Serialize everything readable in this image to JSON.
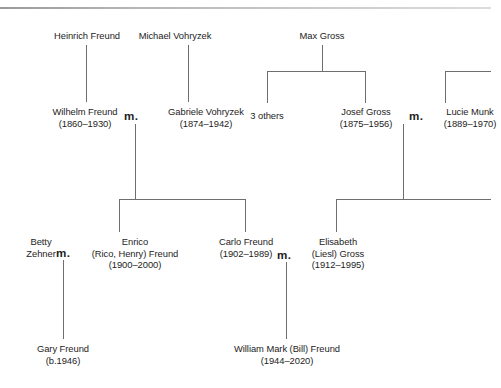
{
  "diagram": {
    "type": "family-tree",
    "title": "",
    "line_color": "#6e6e6e",
    "text_color": "#1d1d1d",
    "background": "#ffffff",
    "marriage_symbol": "m.",
    "generations": [
      {
        "row": 1,
        "people": [
          {
            "id": "heinrich-freund",
            "name": "Heinrich Freund",
            "dates": ""
          },
          {
            "id": "michael-vohryzek",
            "name": "Michael Vohryzek",
            "dates": ""
          },
          {
            "id": "max-gross",
            "name": "Max Gross",
            "dates": ""
          }
        ]
      },
      {
        "row": 2,
        "people": [
          {
            "id": "wilhelm-freund",
            "name": "Wilhelm Freund",
            "dates": "(1860–1930)"
          },
          {
            "id": "gabriele-vohryzek",
            "name": "Gabriele Vohryzek",
            "dates": "(1874–1942)"
          },
          {
            "id": "three-others",
            "name": "3 others",
            "dates": ""
          },
          {
            "id": "josef-gross",
            "name": "Josef Gross",
            "dates": "(1875–1956)"
          },
          {
            "id": "lucie-munk",
            "name": "Lucie Munk",
            "dates": "(1889–1970)"
          }
        ]
      },
      {
        "row": 3,
        "people": [
          {
            "id": "betty-zehner",
            "name": "Betty Zehner",
            "dates": ""
          },
          {
            "id": "enrico-freund",
            "name": "Enrico (Rico, Henry) Freund",
            "dates": "(1900–2000)"
          },
          {
            "id": "carlo-freund",
            "name": "Carlo Freund",
            "dates": "(1902–1989)"
          },
          {
            "id": "elisabeth-gross",
            "name": "Elisabeth (Liesl) Gross",
            "dates": "(1912–1995)"
          }
        ]
      },
      {
        "row": 4,
        "people": [
          {
            "id": "gary-freund",
            "name": "Gary Freund",
            "dates": "(b.1946)"
          },
          {
            "id": "william-freund",
            "name": "William Mark (Bill) Freund",
            "dates": "(1944–2020)"
          }
        ]
      }
    ],
    "marriages": [
      {
        "id": "wilhelm-gabriele",
        "symbol": "m."
      },
      {
        "id": "josef-lucie",
        "symbol": "m."
      },
      {
        "id": "betty-enrico",
        "symbol": "m."
      },
      {
        "id": "carlo-elisabeth",
        "symbol": "m."
      }
    ]
  },
  "nodes": {
    "heinrich_freund": {
      "name": "Heinrich Freund"
    },
    "michael_vohryzek": {
      "name": "Michael Vohryzek"
    },
    "max_gross": {
      "name": "Max Gross"
    },
    "wilhelm_freund": {
      "name": "Wilhelm Freund",
      "dates": "(1860–1930)"
    },
    "gabriele_vohryzek": {
      "name": "Gabriele Vohryzek",
      "dates": "(1874–1942)"
    },
    "three_others": {
      "name": "3 others"
    },
    "josef_gross": {
      "name": "Josef Gross",
      "dates": "(1875–1956)"
    },
    "lucie_munk": {
      "name": "Lucie Munk",
      "dates": "(1889–1970)"
    },
    "betty_zehner_l1": {
      "name": "Betty"
    },
    "betty_zehner_l2": {
      "name": "Zehner"
    },
    "enrico_l1": {
      "name": "Enrico"
    },
    "enrico_l2": {
      "name": "(Rico, Henry) Freund"
    },
    "enrico_dates": {
      "dates": "(1900–2000)"
    },
    "carlo_freund": {
      "name": "Carlo Freund",
      "dates": "(1902–1989)"
    },
    "elisabeth_l1": {
      "name": "Elisabeth"
    },
    "elisabeth_l2": {
      "name": "(Liesl) Gross"
    },
    "elisabeth_dates": {
      "dates": "(1912–1995)"
    },
    "gary_freund": {
      "name": "Gary Freund",
      "dates": "(b.1946)"
    },
    "william_freund": {
      "name": "William Mark (Bill) Freund",
      "dates": "(1944–2020)"
    }
  },
  "marriage_marks": {
    "m1": "m.",
    "m2": "m.",
    "m3": "m.",
    "m4": "m."
  }
}
